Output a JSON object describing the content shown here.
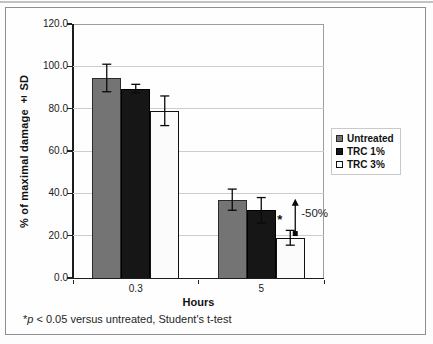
{
  "chart_data": {
    "type": "bar",
    "categories": [
      "0.3",
      "5"
    ],
    "series": [
      {
        "name": "Untreated",
        "values": [
          94.5,
          37.0
        ],
        "errors": [
          6.5,
          5.0
        ],
        "color": "#747474",
        "border": "#2a2a2a"
      },
      {
        "name": "TRC 1%",
        "values": [
          89.5,
          32.0
        ],
        "errors": [
          2.0,
          6.0
        ],
        "color": "#161616",
        "border": "#000000"
      },
      {
        "name": "TRC 3%",
        "values": [
          79.0,
          19.0
        ],
        "errors": [
          7.0,
          3.5
        ],
        "color": "#fbfbfb",
        "border": "#111111"
      }
    ],
    "title": "",
    "xlabel": "Hours",
    "ylabel": "% of maximal damage ± SD",
    "ylim": [
      0,
      120
    ],
    "ytick_step": 20,
    "ytick_labels": [
      "0.0",
      "20.0",
      "40.0",
      "60.0",
      "80.0",
      "100.0",
      "120.0"
    ],
    "grid": true,
    "legend_position": "right",
    "annotations": {
      "significance_marker": "*",
      "significance_at": {
        "category": "5",
        "series": "TRC 3%",
        "value_level": 28
      },
      "arrow": {
        "category": "5",
        "series": "TRC 3%",
        "from_value": 21,
        "to_value": 37
      },
      "arrow_label": "-50%"
    }
  },
  "footnote": {
    "star": "*",
    "p": "p",
    "rest": " < 0.05 versus untreated, Student's t-test"
  }
}
